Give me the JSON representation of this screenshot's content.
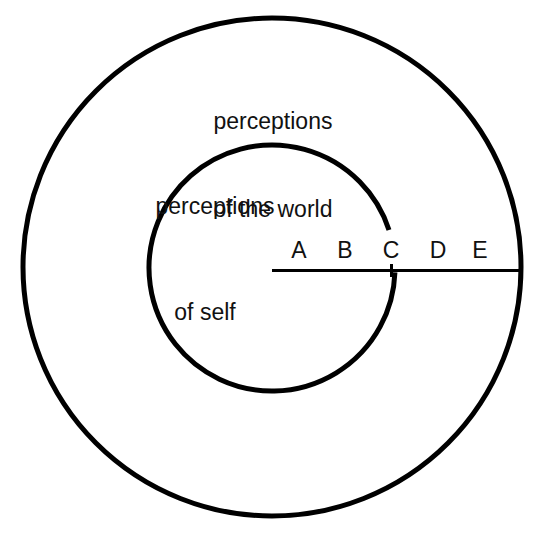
{
  "diagram": {
    "background_color": "#ffffff",
    "stroke_color": "#000000",
    "text_color": "#111111",
    "outer_ring": {
      "label_line_1": "perceptions",
      "label_line_2": "of the world",
      "center_x": 272,
      "center_y": 267,
      "radius": 249,
      "stroke_width": 5
    },
    "inner_ring": {
      "label_line_1": "perceptions",
      "label_line_2": "of self",
      "center_x": 272,
      "center_y": 268,
      "radius": 123,
      "stroke_width": 5,
      "gap_start_degrees": -18,
      "gap_end_degrees": 2
    },
    "axis": {
      "y": 270,
      "x_start": 272,
      "x_end": 521,
      "stroke_width": 3,
      "tick_labels": [
        "A",
        "B",
        "C",
        "D",
        "E"
      ]
    }
  }
}
